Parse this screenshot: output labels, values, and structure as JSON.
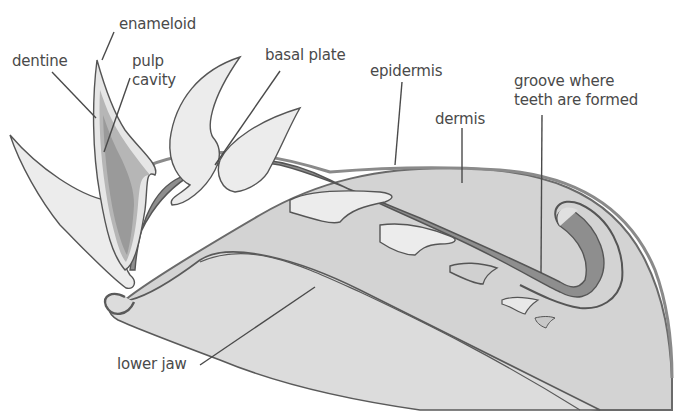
{
  "diagram": {
    "labels": {
      "enameloid": "enameloid",
      "dentine": "dentine",
      "pulp_cavity_line1": "pulp",
      "pulp_cavity_line2": "cavity",
      "basal_plate": "basal plate",
      "epidermis": "epidermis",
      "dermis": "dermis",
      "groove_line1": "groove where",
      "groove_line2": "teeth are formed",
      "lower_jaw": "lower jaw"
    },
    "colors": {
      "background": "#ffffff",
      "jaw_fill": "#d6d6d6",
      "dermis_fill": "#d2d2d2",
      "epidermis_band": "#9a9a9a",
      "basal_band": "#8e8e8e",
      "tooth_fill": "#ececec",
      "pulp_fill": "#a8a8a8",
      "outline": "#555555",
      "label_text": "#4a4a4a"
    }
  }
}
